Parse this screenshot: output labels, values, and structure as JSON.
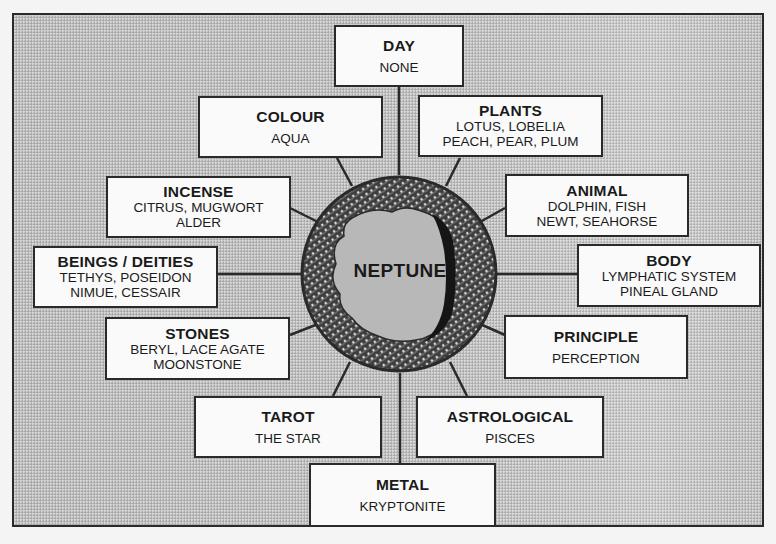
{
  "diagram": {
    "center": {
      "label": "NEPTUNE"
    },
    "boxes": {
      "day": {
        "title": "DAY",
        "lines": [
          "NONE"
        ]
      },
      "colour": {
        "title": "COLOUR",
        "lines": [
          "AQUA"
        ]
      },
      "plants": {
        "title": "PLANTS",
        "lines": [
          "LOTUS, LOBELIA",
          "PEACH, PEAR, PLUM"
        ]
      },
      "incense": {
        "title": "INCENSE",
        "lines": [
          "CITRUS, MUGWORT",
          "ALDER"
        ]
      },
      "animal": {
        "title": "ANIMAL",
        "lines": [
          "DOLPHIN, FISH",
          "NEWT, SEAHORSE"
        ]
      },
      "beings": {
        "title": "BEINGS / DEITIES",
        "lines": [
          "TETHYS, POSEIDON",
          "NIMUE, CESSAIR"
        ]
      },
      "body": {
        "title": "BODY",
        "lines": [
          "LYMPHATIC SYSTEM",
          "PINEAL GLAND"
        ]
      },
      "stones": {
        "title": "STONES",
        "lines": [
          "BERYL, LACE AGATE",
          "MOONSTONE"
        ]
      },
      "principle": {
        "title": "PRINCIPLE",
        "lines": [
          "PERCEPTION"
        ]
      },
      "tarot": {
        "title": "TAROT",
        "lines": [
          "THE STAR"
        ]
      },
      "astrological": {
        "title": "ASTROLOGICAL",
        "lines": [
          "PISCES"
        ]
      },
      "metal": {
        "title": "METAL",
        "lines": [
          "KRYPTONITE"
        ]
      }
    },
    "colors": {
      "background": "#bdbdbd",
      "box_fill": "#fafafa",
      "ink": "#1a1a1a",
      "ring": "#3a3a3a"
    }
  }
}
